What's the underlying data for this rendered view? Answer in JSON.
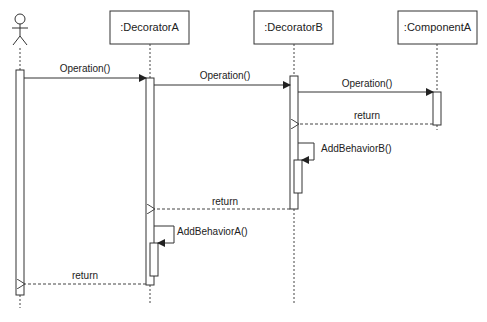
{
  "diagram": {
    "type": "uml-sequence",
    "actor": {
      "name": ""
    },
    "lifelines": [
      {
        "label": ":DecoratorA"
      },
      {
        "label": ":DecoratorB"
      },
      {
        "label": ":ComponentA"
      }
    ],
    "messages": [
      {
        "from": "actor",
        "to": ":DecoratorA",
        "label": "Operation()",
        "kind": "sync"
      },
      {
        "from": ":DecoratorA",
        "to": ":DecoratorB",
        "label": "Operation()",
        "kind": "sync"
      },
      {
        "from": ":DecoratorB",
        "to": ":ComponentA",
        "label": "Operation()",
        "kind": "sync"
      },
      {
        "from": ":ComponentA",
        "to": ":DecoratorB",
        "label": "return",
        "kind": "return"
      },
      {
        "from": ":DecoratorB",
        "to": ":DecoratorB",
        "label": "AddBehaviorB()",
        "kind": "self"
      },
      {
        "from": ":DecoratorB",
        "to": ":DecoratorA",
        "label": "return",
        "kind": "return"
      },
      {
        "from": ":DecoratorA",
        "to": ":DecoratorA",
        "label": "AddBehaviorA()",
        "kind": "self"
      },
      {
        "from": ":DecoratorA",
        "to": "actor",
        "label": "return",
        "kind": "return"
      }
    ]
  }
}
